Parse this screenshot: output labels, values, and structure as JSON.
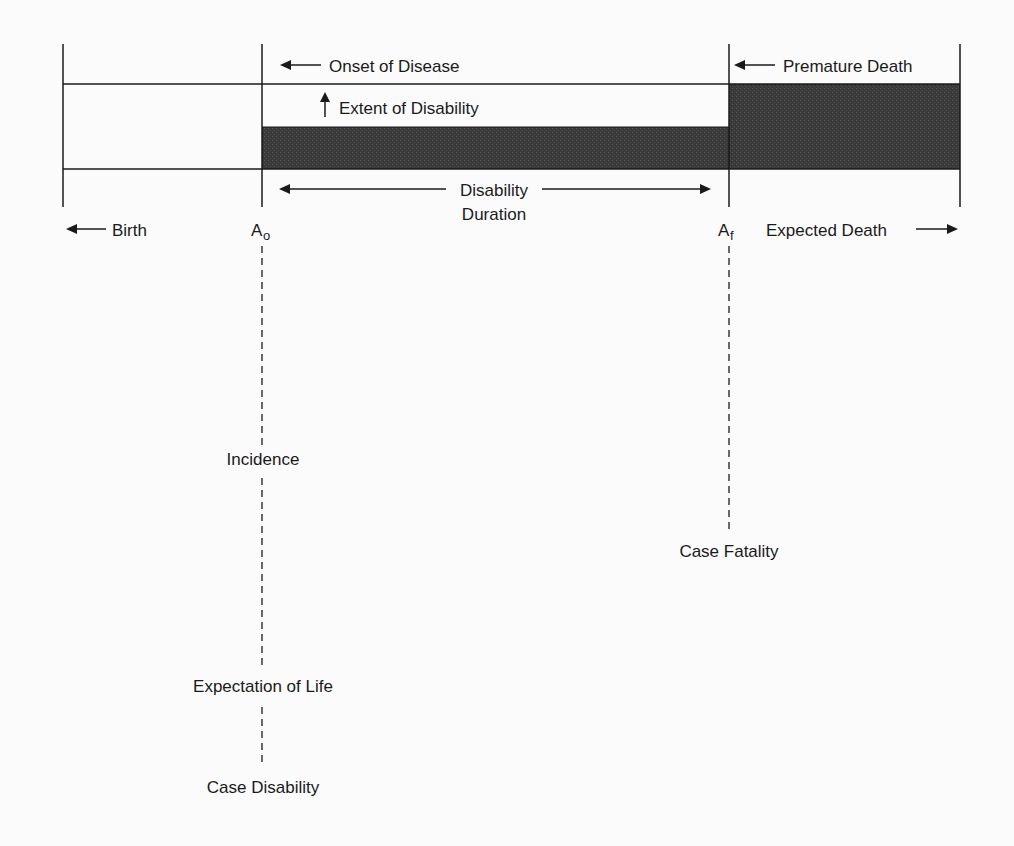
{
  "diagram": {
    "type": "timeline-schematic",
    "colors": {
      "background": "#fbfbfb",
      "line": "#1a1a1a",
      "shaded_fill": "#3a3a3a"
    },
    "markers": {
      "onset_main": "A",
      "onset_sub": "o",
      "final_main": "A",
      "final_sub": "f"
    },
    "labels": {
      "onset_of_disease": "Onset of Disease",
      "extent_of_disability": "Extent of Disability",
      "premature_death": "Premature Death",
      "disability_duration_line1": "Disability",
      "disability_duration_line2": "Duration",
      "birth": "Birth",
      "expected_death": "Expected Death",
      "incidence": "Incidence",
      "case_fatality": "Case Fatality",
      "expectation_of_life": "Expectation of Life",
      "case_disability": "Case Disability"
    },
    "regions": [
      {
        "name": "healthy-life",
        "from": "Birth",
        "to": "A_o",
        "shaded": false
      },
      {
        "name": "disability-period",
        "from": "A_o",
        "to": "A_f",
        "shaded": true,
        "height": "partial"
      },
      {
        "name": "premature-death-period",
        "from": "A_f",
        "to": "Expected Death",
        "shaded": true,
        "height": "full"
      }
    ]
  }
}
